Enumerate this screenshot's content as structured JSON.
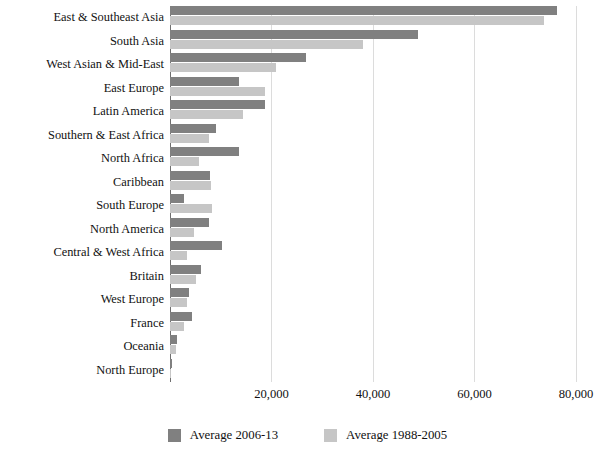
{
  "chart_data": {
    "type": "bar",
    "orientation": "horizontal",
    "title": "",
    "xlabel": "",
    "ylabel": "",
    "xlim": [
      0,
      80000
    ],
    "grid": true,
    "legend_position": "bottom-center",
    "xticks": [
      "20,000",
      "40,000",
      "60,000",
      "80,000"
    ],
    "xtick_values": [
      20000,
      40000,
      60000,
      80000
    ],
    "categories": [
      "East & Southeast Asia",
      "South Asia",
      "West Asian & Mid-East",
      "East Europe",
      "Latin America",
      "Southern & East Africa",
      "North Africa",
      "Caribbean",
      "South Europe",
      "North America",
      "Central & West Africa",
      "Britain",
      "West Europe",
      "France",
      "Oceania",
      "North Europe"
    ],
    "series": [
      {
        "name": "Average 2006-13",
        "color": "#808080",
        "values": [
          76300,
          48800,
          26700,
          13500,
          18800,
          9100,
          13500,
          7900,
          2800,
          7700,
          10300,
          6100,
          3800,
          4400,
          1300,
          300
        ]
      },
      {
        "name": "Average 1988-2005",
        "color": "#c6c6c6",
        "values": [
          73700,
          38100,
          20900,
          18800,
          14300,
          7700,
          5700,
          8100,
          8300,
          4800,
          3400,
          5100,
          3400,
          2800,
          1100,
          200
        ]
      }
    ]
  },
  "legend": {
    "items": [
      {
        "label": "Average 2006-13",
        "swatch": "recent"
      },
      {
        "label": "Average 1988-2005",
        "swatch": "older"
      }
    ]
  }
}
